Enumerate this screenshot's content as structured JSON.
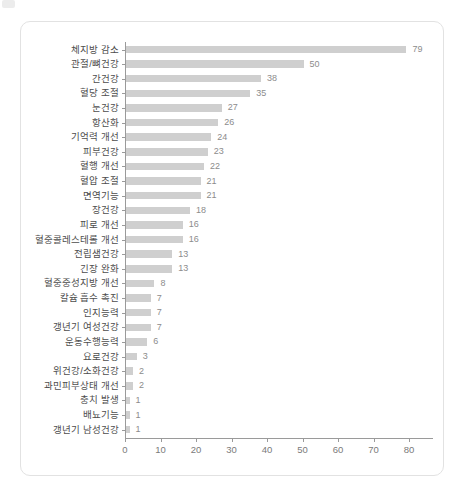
{
  "chart_data": {
    "type": "bar",
    "orientation": "horizontal",
    "title": "",
    "xlabel": "",
    "ylabel": "",
    "categories": [
      "체지방 감소",
      "관절/뼈건강",
      "간건강",
      "혈당 조절",
      "눈건강",
      "항산화",
      "기억력 개선",
      "피부건강",
      "혈행 개선",
      "혈압 조절",
      "면역기능",
      "장건강",
      "피로 개선",
      "혈중콜레스테롤 개선",
      "전립샘건강",
      "긴장 완화",
      "혈중중성지방 개선",
      "칼슘 흡수 촉진",
      "인지능력",
      "갱년기 여성건강",
      "운동수행능력",
      "요로건강",
      "위건강/소화건강",
      "과민피부상태 개선",
      "충치 발생",
      "배뇨기능",
      "갱년기 남성건강"
    ],
    "values": [
      79,
      50,
      38,
      35,
      27,
      26,
      24,
      23,
      22,
      21,
      21,
      18,
      16,
      16,
      13,
      13,
      8,
      7,
      7,
      7,
      6,
      3,
      2,
      2,
      1,
      1,
      1
    ],
    "value_labels_shown": true,
    "x_ticks": [
      0,
      10,
      20,
      30,
      40,
      50,
      60,
      70,
      80
    ],
    "xlim": [
      0,
      87
    ],
    "grid": false,
    "legend": null,
    "colors": {
      "bar": "#cfcfcf",
      "axis": "#9a9a9a",
      "category_label": "#4d4d4d",
      "value_label": "#8c8c8c",
      "tick_label": "#7a7a7a",
      "card_border": "#e2e2e2",
      "background": "#ffffff"
    }
  }
}
